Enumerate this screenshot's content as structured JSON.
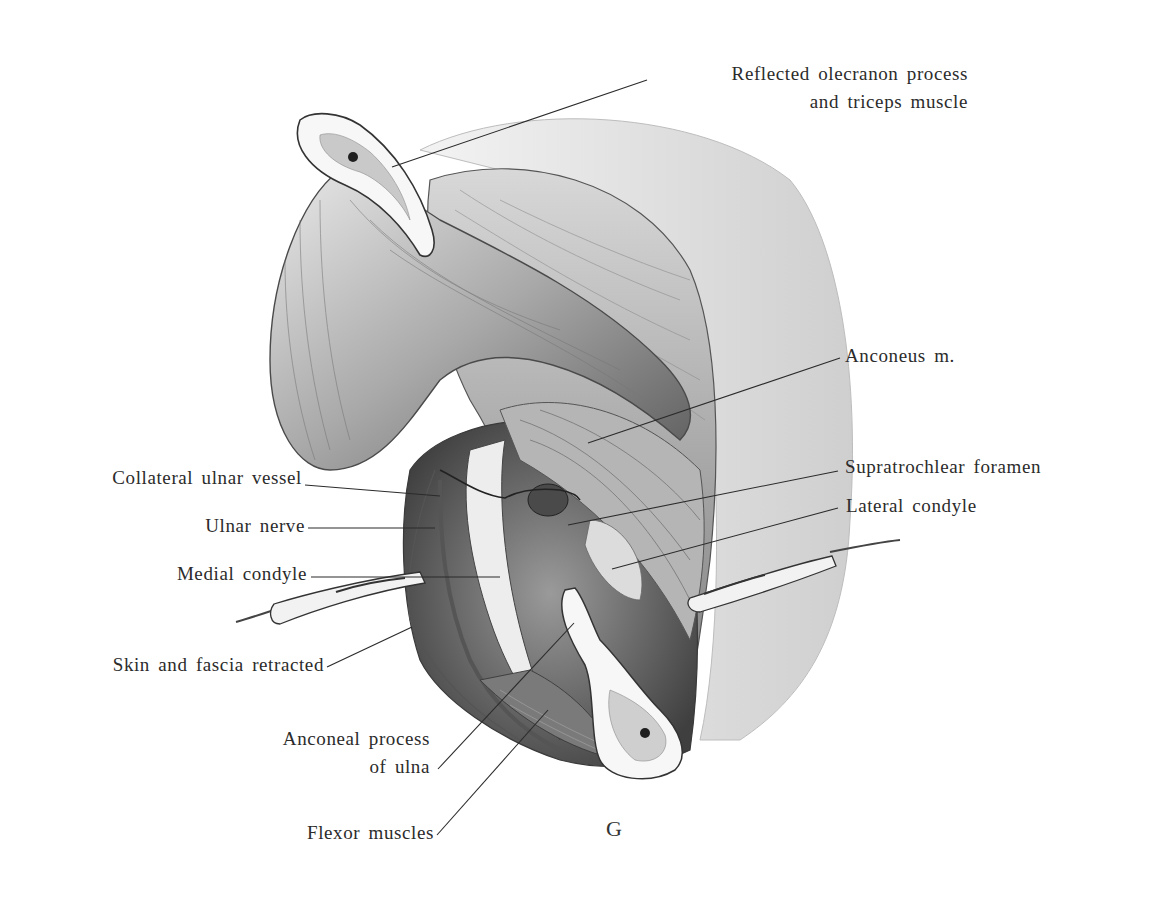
{
  "figure": {
    "plate_letter": "G",
    "colors": {
      "background": "#ffffff",
      "ink": "#2b2b2b",
      "muscle_shade": "#6e6e6e",
      "bone": "#f4f4f4",
      "skin": "#e6e6e6"
    }
  },
  "labels": {
    "reflected_olecranon": {
      "line1": "Reflected olecranon process",
      "line2": "and triceps muscle"
    },
    "anconeus": "Anconeus m.",
    "collateral_ulnar_vessel": "Collateral ulnar vessel",
    "supratrochlear_foramen": "Supratrochlear foramen",
    "ulnar_nerve": "Ulnar nerve",
    "lateral_condyle": "Lateral condyle",
    "medial_condyle": "Medial condyle",
    "skin_fascia": "Skin and fascia retracted",
    "anconeal_process": {
      "line1": "Anconeal process",
      "line2": "of ulna"
    },
    "flexor_muscles": "Flexor muscles"
  }
}
